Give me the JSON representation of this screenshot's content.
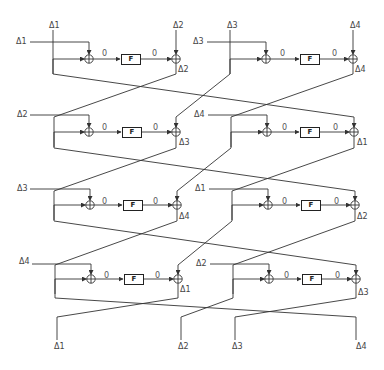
{
  "diagram": {
    "top_labels": [
      "Δ1",
      "Δ2",
      "Δ3",
      "Δ4"
    ],
    "bottom_labels": [
      "Δ1",
      "Δ2",
      "Δ3",
      "Δ4"
    ],
    "zero_label": "0",
    "f_label": "F",
    "rounds": [
      {
        "left": {
          "input": "Δ1",
          "output": "Δ2"
        },
        "right": {
          "input": "Δ3",
          "output": "Δ4"
        }
      },
      {
        "left": {
          "input": "Δ2",
          "output": "Δ3"
        },
        "right": {
          "input": "Δ4",
          "output": "Δ1"
        }
      },
      {
        "left": {
          "input": "Δ3",
          "output": "Δ4"
        },
        "right": {
          "input": "Δ1",
          "output": "Δ2"
        }
      },
      {
        "left": {
          "input": "Δ4",
          "output": "Δ1"
        },
        "right": {
          "input": "Δ2",
          "output": "Δ3"
        }
      }
    ],
    "colors": {
      "line": "#333333",
      "text": "#444444"
    }
  }
}
